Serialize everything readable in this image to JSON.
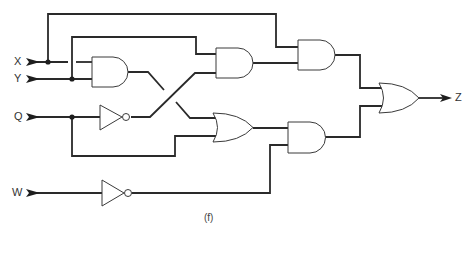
{
  "diagram": {
    "type": "logic-circuit",
    "caption": "(f)",
    "inputs": [
      {
        "id": "X",
        "label": "X"
      },
      {
        "id": "Y",
        "label": "Y"
      },
      {
        "id": "Q",
        "label": "Q"
      },
      {
        "id": "W",
        "label": "W"
      }
    ],
    "outputs": [
      {
        "id": "Z",
        "label": "Z"
      }
    ],
    "gates": [
      {
        "id": "and1",
        "type": "AND",
        "inputs": [
          "X",
          "Y"
        ]
      },
      {
        "id": "not1",
        "type": "NOT",
        "inputs": [
          "Q"
        ]
      },
      {
        "id": "and2",
        "type": "AND",
        "inputs": [
          "Y",
          "not1"
        ]
      },
      {
        "id": "or1",
        "type": "OR",
        "inputs": [
          "and1",
          "Q"
        ]
      },
      {
        "id": "and3",
        "type": "AND",
        "inputs": [
          "X",
          "and2"
        ]
      },
      {
        "id": "not2",
        "type": "NOT",
        "inputs": [
          "W"
        ]
      },
      {
        "id": "and4",
        "type": "AND",
        "inputs": [
          "or1",
          "not2"
        ]
      },
      {
        "id": "or2",
        "type": "OR",
        "inputs": [
          "and3",
          "and4"
        ],
        "output": "Z"
      }
    ]
  }
}
